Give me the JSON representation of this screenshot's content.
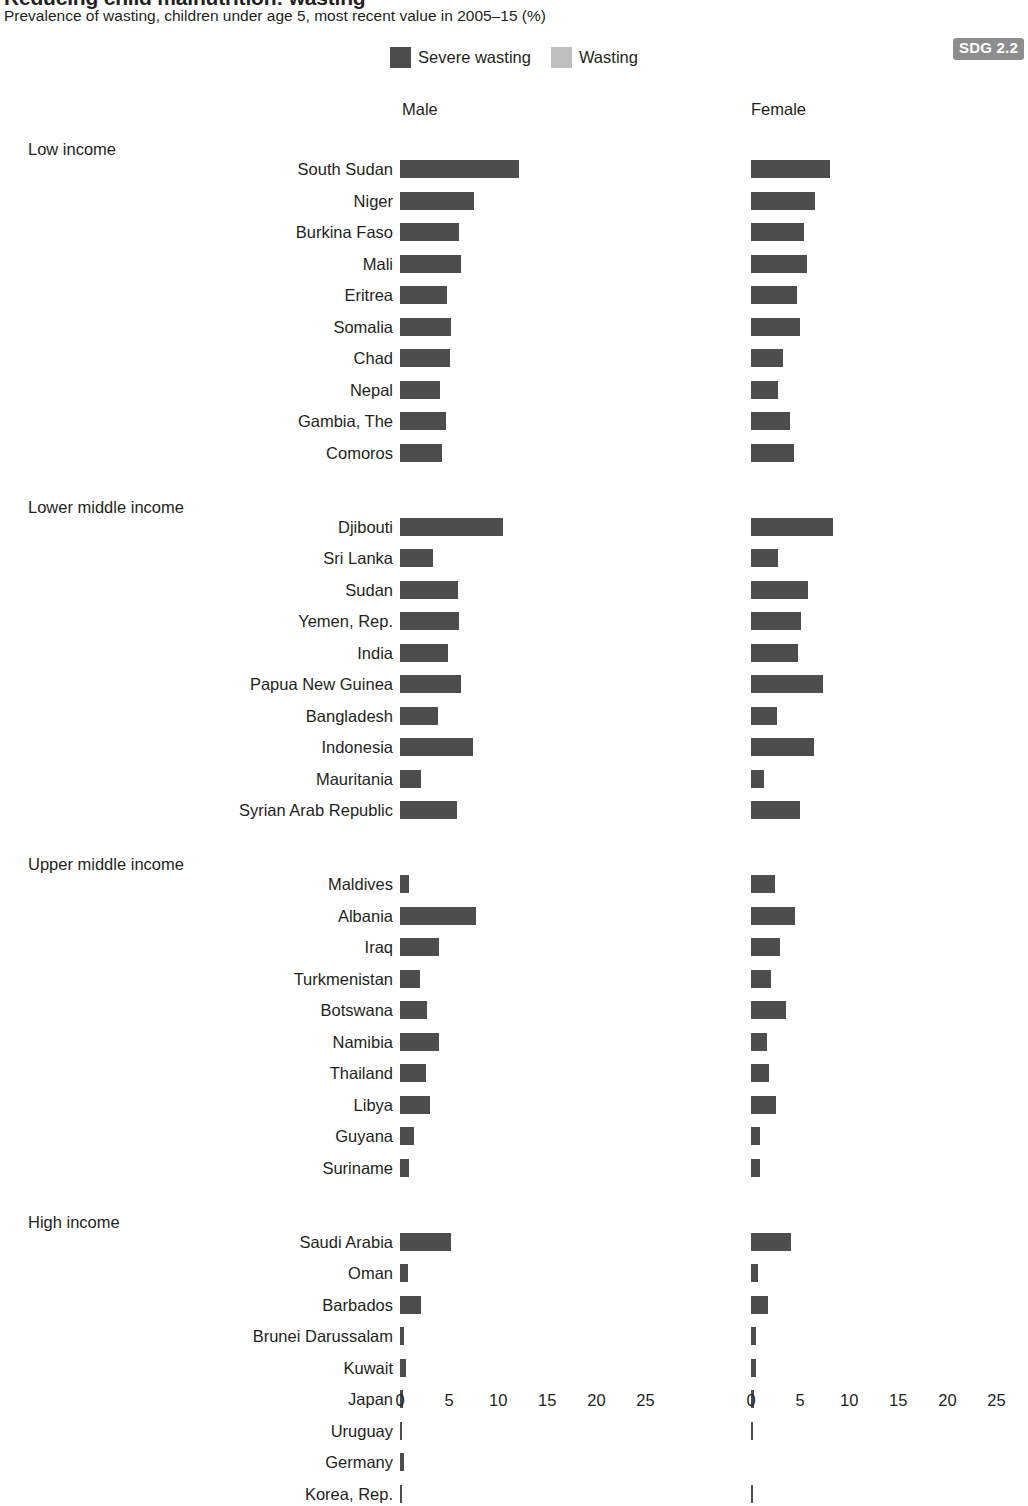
{
  "header": {
    "title": "Reducing child malnutrition: wasting",
    "subtitle": "Prevalence of wasting, children under age 5, most recent value in 2005–15 (%)",
    "badge": "SDG 2.2"
  },
  "legend": {
    "position": "top-center",
    "entries": [
      {
        "label": "Severe wasting",
        "color": "#4d4d4d",
        "icon": "square-swatch"
      },
      {
        "label": "Wasting",
        "color": "#bfbfbf",
        "icon": "square-swatch"
      }
    ]
  },
  "panels": [
    {
      "id": "male",
      "label": "Male"
    },
    {
      "id": "female",
      "label": "Female"
    }
  ],
  "axis": {
    "ticks": [
      "0",
      "5",
      "10",
      "15",
      "20",
      "25"
    ],
    "min": 0,
    "max": 27.5
  },
  "chart_data": {
    "type": "bar",
    "orientation": "horizontal",
    "stacked": true,
    "title": "Reducing child malnutrition: wasting",
    "subtitle": "Prevalence of wasting, children under age 5, most recent value in 2005–15 (%)",
    "xlabel": "",
    "ylabel": "",
    "xlim": [
      0,
      27.5
    ],
    "xticks": [
      0,
      5,
      10,
      15,
      20,
      25
    ],
    "grid": false,
    "legend_position": "top-center",
    "panels": [
      "Male",
      "Female"
    ],
    "series": [
      {
        "name": "Severe wasting",
        "color": "#4d4d4d"
      },
      {
        "name": "Wasting",
        "color": "#bfbfbf"
      }
    ],
    "groups": [
      {
        "name": "Low income",
        "rows": [
          {
            "country": "South Sudan",
            "male_wasting": 26.2,
            "male_severe": 12.1,
            "female_wasting": 20.0,
            "female_severe": 8.0
          },
          {
            "country": "Niger",
            "male_wasting": 20.1,
            "male_severe": 7.5,
            "female_wasting": 18.4,
            "female_severe": 6.5
          },
          {
            "country": "Burkina Faso",
            "male_wasting": 16.6,
            "male_severe": 6.0,
            "female_wasting": 14.8,
            "female_severe": 5.4
          },
          {
            "country": "Mali",
            "male_wasting": 16.2,
            "male_severe": 6.2,
            "female_wasting": 14.6,
            "female_severe": 5.7
          },
          {
            "country": "Eritrea",
            "male_wasting": 16.3,
            "male_severe": 4.8,
            "female_wasting": 14.5,
            "female_severe": 4.7
          },
          {
            "country": "Somalia",
            "male_wasting": 16.2,
            "male_severe": 5.2,
            "female_wasting": 13.6,
            "female_severe": 5.0
          },
          {
            "country": "Chad",
            "male_wasting": 14.7,
            "male_severe": 5.1,
            "female_wasting": 11.8,
            "female_severe": 3.3
          },
          {
            "country": "Nepal",
            "male_wasting": 12.6,
            "male_severe": 4.1,
            "female_wasting": 10.6,
            "female_severe": 2.7
          },
          {
            "country": "Gambia, The",
            "male_wasting": 11.9,
            "male_severe": 4.7,
            "female_wasting": 10.8,
            "female_severe": 4.0
          },
          {
            "country": "Comoros",
            "male_wasting": 11.5,
            "male_severe": 4.3,
            "female_wasting": 10.7,
            "female_severe": 4.4
          }
        ]
      },
      {
        "name": "Lower middle income",
        "rows": [
          {
            "country": "Djibouti",
            "male_wasting": 23.6,
            "male_severe": 10.5,
            "female_wasting": 20.7,
            "female_severe": 8.3
          },
          {
            "country": "Sri Lanka",
            "male_wasting": 22.9,
            "male_severe": 3.4,
            "female_wasting": 21.1,
            "female_severe": 2.7
          },
          {
            "country": "Sudan",
            "male_wasting": 15.3,
            "male_severe": 5.9,
            "female_wasting": 14.1,
            "female_severe": 5.8
          },
          {
            "country": "Yemen, Rep.",
            "male_wasting": 18.0,
            "male_severe": 6.0,
            "female_wasting": 15.1,
            "female_severe": 5.1
          },
          {
            "country": "India",
            "male_wasting": 16.0,
            "male_severe": 4.9,
            "female_wasting": 15.1,
            "female_severe": 4.8
          },
          {
            "country": "Papua New Guinea",
            "male_wasting": 14.4,
            "male_severe": 6.2,
            "female_wasting": 14.0,
            "female_severe": 7.3
          },
          {
            "country": "Bangladesh",
            "male_wasting": 15.2,
            "male_severe": 3.9,
            "female_wasting": 14.1,
            "female_severe": 2.6
          },
          {
            "country": "Indonesia",
            "main": 0,
            "male_wasting": 14.6,
            "male_severe": 7.4,
            "female_wasting": 13.0,
            "female_severe": 6.4
          },
          {
            "country": "Mauritania",
            "male_wasting": 13.5,
            "male_severe": 2.1,
            "female_wasting": 10.4,
            "female_severe": 1.3
          },
          {
            "country": "Syrian Arab Republic",
            "male_wasting": 12.5,
            "male_severe": 5.8,
            "female_wasting": 10.9,
            "female_severe": 5.0
          }
        ]
      },
      {
        "name": "Upper middle income",
        "rows": [
          {
            "country": "Maldives",
            "male_wasting": 13.4,
            "male_severe": 0.9,
            "female_wasting": 10.4,
            "female_severe": 2.4
          },
          {
            "country": "Albania",
            "male_wasting": 11.5,
            "male_severe": 7.7,
            "female_wasting": 7.4,
            "female_severe": 4.5
          },
          {
            "country": "Iraq",
            "male_wasting": 8.2,
            "male_severe": 4.0,
            "female_wasting": 7.0,
            "female_severe": 3.0
          },
          {
            "country": "Turkmenistan",
            "male_wasting": 7.5,
            "male_severe": 2.0,
            "female_wasting": 7.3,
            "female_severe": 2.0
          },
          {
            "country": "Botswana",
            "male_wasting": 7.0,
            "male_severe": 2.7,
            "female_wasting": 6.9,
            "female_severe": 3.6
          },
          {
            "country": "Namibia",
            "male_wasting": 9.3,
            "male_severe": 4.0,
            "female_wasting": 5.4,
            "female_severe": 1.6
          },
          {
            "country": "Thailand",
            "male_wasting": 7.3,
            "male_severe": 2.6,
            "female_wasting": 6.1,
            "female_severe": 1.8
          },
          {
            "country": "Libya",
            "male_wasting": 6.8,
            "male_severe": 3.1,
            "female_wasting": 6.0,
            "female_severe": 2.5
          },
          {
            "country": "Guyana",
            "male_wasting": 7.0,
            "male_severe": 1.4,
            "female_wasting": 4.2,
            "female_severe": 0.9
          },
          {
            "country": "Suriname",
            "male_wasting": 5.7,
            "male_severe": 0.9,
            "female_wasting": 4.2,
            "female_severe": 0.9
          }
        ]
      },
      {
        "name": "High income",
        "rows": [
          {
            "country": "Saudi Arabia",
            "male_wasting": 13.1,
            "male_severe": 5.2,
            "female_wasting": 10.7,
            "female_severe": 4.1
          },
          {
            "country": "Oman",
            "male_wasting": 8.0,
            "male_severe": 0.8,
            "female_wasting": 6.0,
            "female_severe": 0.7
          },
          {
            "country": "Barbados",
            "male_wasting": 8.1,
            "male_severe": 2.1,
            "female_wasting": 5.1,
            "female_severe": 1.7
          },
          {
            "country": "Brunei Darussalam",
            "male_wasting": 2.9,
            "male_severe": 0.4,
            "female_wasting": 2.8,
            "female_severe": 0.5
          },
          {
            "country": "Kuwait",
            "male_wasting": 2.6,
            "male_severe": 0.6,
            "female_wasting": 1.8,
            "female_severe": 0.5
          },
          {
            "country": "Japan",
            "male_wasting": 2.8,
            "male_severe": 0.3,
            "female_wasting": 1.6,
            "female_severe": 0.3
          },
          {
            "country": "Uruguay",
            "male_wasting": 1.2,
            "male_severe": 0.1,
            "female_wasting": 0.8,
            "female_severe": 0.2
          },
          {
            "country": "Germany",
            "male_wasting": 1.0,
            "male_severe": 0.4,
            "female_wasting": 1.1,
            "female_severe": 0.0
          },
          {
            "country": "Korea, Rep.",
            "male_wasting": 1.2,
            "male_severe": 0.1,
            "female_wasting": 1.0,
            "female_severe": 0.2
          }
        ]
      }
    ]
  }
}
